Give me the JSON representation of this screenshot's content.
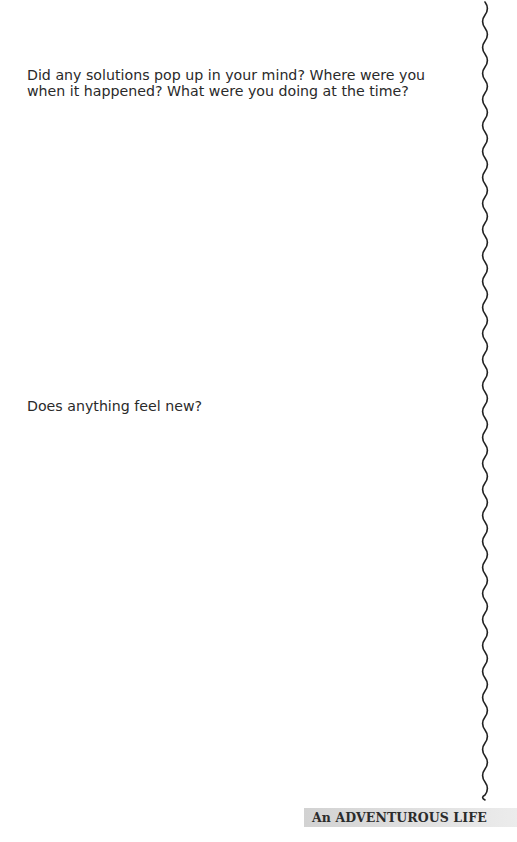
{
  "prompts": [
    {
      "text": "Did any solutions pop up in your mind? Where were you when it happened? What were you doing at the time?"
    },
    {
      "text": "Does anything feel new?"
    }
  ],
  "footer": {
    "title": "An ADVENTUROUS LIFE",
    "background_color": "#dcdcdc"
  },
  "decoration": {
    "wave_line": "wavy-vertical-divider",
    "wave_color": "#222222"
  }
}
